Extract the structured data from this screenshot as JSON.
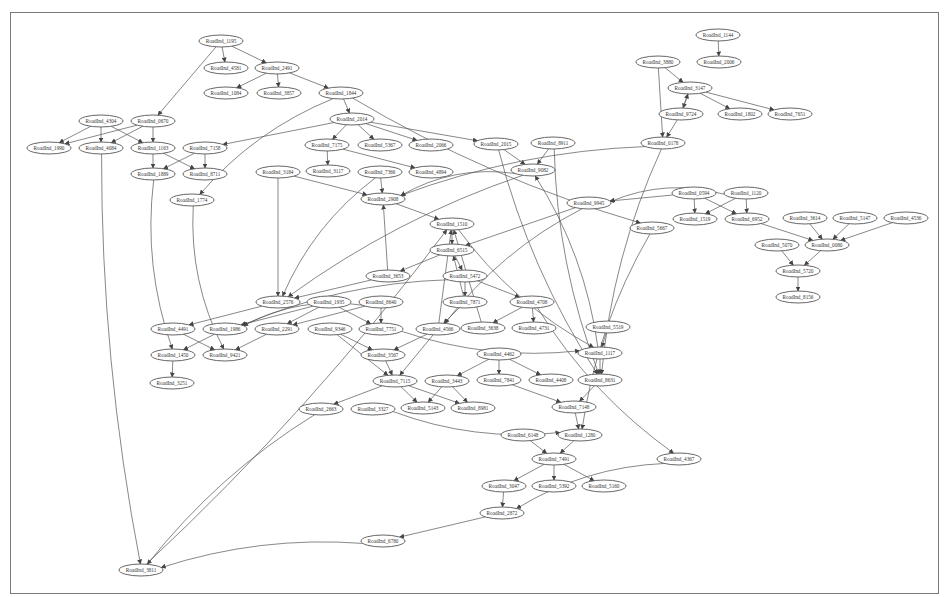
{
  "diagram": {
    "type": "directed-graph",
    "node_prefix": "RoadInd_",
    "nodes": [
      {
        "id": "n1195",
        "label": "RoadInd_1195",
        "x": 221,
        "y": 41
      },
      {
        "id": "n4581",
        "label": "RoadInd_4581",
        "x": 226,
        "y": 68
      },
      {
        "id": "n2491",
        "label": "RoadInd_2491",
        "x": 277,
        "y": 68
      },
      {
        "id": "n1084",
        "label": "RoadInd_1084",
        "x": 226,
        "y": 93
      },
      {
        "id": "n3857",
        "label": "RoadInd_3857",
        "x": 279,
        "y": 93
      },
      {
        "id": "n1844",
        "label": "RoadInd_1844",
        "x": 341,
        "y": 93
      },
      {
        "id": "n1144",
        "label": "RoadInd_1144",
        "x": 718,
        "y": 35
      },
      {
        "id": "n3880",
        "label": "RoadInd_3880",
        "x": 658,
        "y": 62
      },
      {
        "id": "n2006",
        "label": "RoadInd_2006",
        "x": 719,
        "y": 62
      },
      {
        "id": "n3147",
        "label": "RoadInd_3147",
        "x": 690,
        "y": 88
      },
      {
        "id": "n9724",
        "label": "RoadInd_9724",
        "x": 681,
        "y": 114
      },
      {
        "id": "n1802",
        "label": "RoadInd_1802",
        "x": 740,
        "y": 114
      },
      {
        "id": "n7651",
        "label": "RoadInd_7651",
        "x": 790,
        "y": 114
      },
      {
        "id": "n4304",
        "label": "RoadInd_4304",
        "x": 101,
        "y": 121
      },
      {
        "id": "n0670",
        "label": "RoadInd_0670",
        "x": 153,
        "y": 121
      },
      {
        "id": "n2014",
        "label": "RoadInd_2014",
        "x": 352,
        "y": 119
      },
      {
        "id": "n1990",
        "label": "RoadInd_1990",
        "x": 49,
        "y": 148
      },
      {
        "id": "n4084",
        "label": "RoadInd_4084",
        "x": 101,
        "y": 148
      },
      {
        "id": "n1163",
        "label": "RoadInd_1163",
        "x": 153,
        "y": 148
      },
      {
        "id": "n7158",
        "label": "RoadInd_7158",
        "x": 205,
        "y": 148
      },
      {
        "id": "n7175",
        "label": "RoadInd_7175",
        "x": 327,
        "y": 145
      },
      {
        "id": "n5367",
        "label": "RoadInd_5367",
        "x": 380,
        "y": 145
      },
      {
        "id": "n2066",
        "label": "RoadInd_2066",
        "x": 431,
        "y": 145
      },
      {
        "id": "n2015",
        "label": "RoadInd_2015",
        "x": 496,
        "y": 144
      },
      {
        "id": "n8911",
        "label": "RoadInd_8911",
        "x": 553,
        "y": 143
      },
      {
        "id": "n0178",
        "label": "RoadInd_0178",
        "x": 663,
        "y": 143
      },
      {
        "id": "n1889",
        "label": "RoadInd_1889",
        "x": 153,
        "y": 174
      },
      {
        "id": "n8711",
        "label": "RoadInd_8711",
        "x": 205,
        "y": 174
      },
      {
        "id": "n3184",
        "label": "RoadInd_3184",
        "x": 278,
        "y": 172
      },
      {
        "id": "n3117",
        "label": "RoadInd_3117",
        "x": 328,
        "y": 171
      },
      {
        "id": "n7366",
        "label": "RoadInd_7366",
        "x": 380,
        "y": 172
      },
      {
        "id": "n4894",
        "label": "RoadInd_4894",
        "x": 431,
        "y": 172
      },
      {
        "id": "n9082",
        "label": "RoadInd_9082",
        "x": 533,
        "y": 170
      },
      {
        "id": "n1774",
        "label": "RoadInd_1774",
        "x": 192,
        "y": 200
      },
      {
        "id": "n2908",
        "label": "RoadInd_2908",
        "x": 383,
        "y": 199
      },
      {
        "id": "n0594",
        "label": "RoadInd_0594",
        "x": 694,
        "y": 193
      },
      {
        "id": "n1120",
        "label": "RoadInd_1120",
        "x": 746,
        "y": 193
      },
      {
        "id": "n9945",
        "label": "RoadInd_9945",
        "x": 589,
        "y": 203
      },
      {
        "id": "n1519",
        "label": "RoadInd_1519",
        "x": 695,
        "y": 219
      },
      {
        "id": "n6952",
        "label": "RoadInd_6952",
        "x": 747,
        "y": 219
      },
      {
        "id": "n3614",
        "label": "RoadInd_3614",
        "x": 805,
        "y": 218
      },
      {
        "id": "n5147",
        "label": "RoadInd_5147",
        "x": 855,
        "y": 218
      },
      {
        "id": "n4536",
        "label": "RoadInd_4536",
        "x": 906,
        "y": 218
      },
      {
        "id": "n1510",
        "label": "RoadInd_1510",
        "x": 452,
        "y": 224
      },
      {
        "id": "n5667",
        "label": "RoadInd_5667",
        "x": 652,
        "y": 228
      },
      {
        "id": "n6515",
        "label": "RoadInd_6515",
        "x": 452,
        "y": 250
      },
      {
        "id": "n5070",
        "label": "RoadInd_5070",
        "x": 777,
        "y": 245
      },
      {
        "id": "n0080",
        "label": "RoadInd_0080",
        "x": 827,
        "y": 245
      },
      {
        "id": "n3653",
        "label": "RoadInd_3653",
        "x": 388,
        "y": 276
      },
      {
        "id": "n5472",
        "label": "RoadInd_5472",
        "x": 465,
        "y": 276
      },
      {
        "id": "n5720",
        "label": "RoadInd_5720",
        "x": 798,
        "y": 271
      },
      {
        "id": "n2576",
        "label": "RoadInd_2576",
        "x": 278,
        "y": 302
      },
      {
        "id": "n1935",
        "label": "RoadInd_1935",
        "x": 329,
        "y": 302
      },
      {
        "id": "n8640",
        "label": "RoadInd_8640",
        "x": 381,
        "y": 302
      },
      {
        "id": "n7871",
        "label": "RoadInd_7871",
        "x": 465,
        "y": 302
      },
      {
        "id": "n4708",
        "label": "RoadInd_4708",
        "x": 532,
        "y": 302
      },
      {
        "id": "n8156",
        "label": "RoadInd_8156",
        "x": 798,
        "y": 297
      },
      {
        "id": "n4491",
        "label": "RoadInd_4491",
        "x": 173,
        "y": 329
      },
      {
        "id": "n1986",
        "label": "RoadInd_1986",
        "x": 225,
        "y": 329
      },
      {
        "id": "n2291",
        "label": "RoadInd_2291",
        "x": 277,
        "y": 329
      },
      {
        "id": "n9346",
        "label": "RoadInd_9346",
        "x": 330,
        "y": 329
      },
      {
        "id": "n7751",
        "label": "RoadInd_7751",
        "x": 381,
        "y": 329
      },
      {
        "id": "n4566",
        "label": "RoadInd_4566",
        "x": 438,
        "y": 329
      },
      {
        "id": "n3638",
        "label": "RoadInd_3638",
        "x": 483,
        "y": 328
      },
      {
        "id": "n4731",
        "label": "RoadInd_4731",
        "x": 534,
        "y": 328
      },
      {
        "id": "n5519",
        "label": "RoadInd_5519",
        "x": 608,
        "y": 327
      },
      {
        "id": "n1450",
        "label": "RoadInd_1450",
        "x": 173,
        "y": 355
      },
      {
        "id": "n9421",
        "label": "RoadInd_9421",
        "x": 225,
        "y": 355
      },
      {
        "id": "n3567",
        "label": "RoadInd_3567",
        "x": 383,
        "y": 355
      },
      {
        "id": "n4462",
        "label": "RoadInd_4462",
        "x": 499,
        "y": 354
      },
      {
        "id": "n1117",
        "label": "RoadInd_1117",
        "x": 600,
        "y": 353
      },
      {
        "id": "n3251",
        "label": "RoadInd_3251",
        "x": 172,
        "y": 383
      },
      {
        "id": "n7115",
        "label": "RoadInd_7115",
        "x": 395,
        "y": 381
      },
      {
        "id": "n3443",
        "label": "RoadInd_3443",
        "x": 447,
        "y": 381
      },
      {
        "id": "n7841",
        "label": "RoadInd_7841",
        "x": 499,
        "y": 380
      },
      {
        "id": "n4408",
        "label": "RoadInd_4408",
        "x": 551,
        "y": 380
      },
      {
        "id": "n8631",
        "label": "RoadInd_8631",
        "x": 600,
        "y": 380
      },
      {
        "id": "n2663",
        "label": "RoadInd_2663",
        "x": 321,
        "y": 409
      },
      {
        "id": "n3327",
        "label": "RoadInd_3327",
        "x": 373,
        "y": 409
      },
      {
        "id": "n5143",
        "label": "RoadInd_5143",
        "x": 423,
        "y": 408
      },
      {
        "id": "n8981",
        "label": "RoadInd_8981",
        "x": 473,
        "y": 408
      },
      {
        "id": "n7148",
        "label": "RoadInd_7148",
        "x": 574,
        "y": 407
      },
      {
        "id": "n6148",
        "label": "RoadInd_6148",
        "x": 523,
        "y": 435
      },
      {
        "id": "n1280",
        "label": "RoadInd_1280",
        "x": 580,
        "y": 435
      },
      {
        "id": "n4367",
        "label": "RoadInd_4367",
        "x": 679,
        "y": 459
      },
      {
        "id": "n7491",
        "label": "RoadInd_7491",
        "x": 554,
        "y": 459
      },
      {
        "id": "n3047",
        "label": "RoadInd_3047",
        "x": 504,
        "y": 486
      },
      {
        "id": "n5392",
        "label": "RoadInd_5392",
        "x": 554,
        "y": 486
      },
      {
        "id": "n5160",
        "label": "RoadInd_5160",
        "x": 604,
        "y": 486
      },
      {
        "id": "n2872",
        "label": "RoadInd_2872",
        "x": 502,
        "y": 513
      },
      {
        "id": "n6780",
        "label": "RoadInd_6780",
        "x": 383,
        "y": 541
      },
      {
        "id": "n3811",
        "label": "RoadInd_3811",
        "x": 141,
        "y": 570
      }
    ],
    "edges": [
      [
        "n1195",
        "n4581"
      ],
      [
        "n1195",
        "n2491"
      ],
      [
        "n1195",
        "n0670"
      ],
      [
        "n2491",
        "n1084"
      ],
      [
        "n2491",
        "n3857"
      ],
      [
        "n2491",
        "n1844"
      ],
      [
        "n1844",
        "n2014"
      ],
      [
        "n1844",
        "n1774"
      ],
      [
        "n1844",
        "n5667"
      ],
      [
        "n1144",
        "n2006"
      ],
      [
        "n3880",
        "n3147"
      ],
      [
        "n3880",
        "n0178"
      ],
      [
        "n3147",
        "n9724"
      ],
      [
        "n9724",
        "n3147"
      ],
      [
        "n3147",
        "n1802"
      ],
      [
        "n3147",
        "n7651"
      ],
      [
        "n9724",
        "n0178"
      ],
      [
        "n4304",
        "n1990"
      ],
      [
        "n4304",
        "n4084"
      ],
      [
        "n4304",
        "n1163"
      ],
      [
        "n0670",
        "n1990"
      ],
      [
        "n0670",
        "n4084"
      ],
      [
        "n0670",
        "n1163"
      ],
      [
        "n1163",
        "n1889"
      ],
      [
        "n1163",
        "n8711"
      ],
      [
        "n7158",
        "n1889"
      ],
      [
        "n7158",
        "n8711"
      ],
      [
        "n2014",
        "n7158"
      ],
      [
        "n2014",
        "n7175"
      ],
      [
        "n2014",
        "n5367"
      ],
      [
        "n2014",
        "n2066"
      ],
      [
        "n2014",
        "n2015"
      ],
      [
        "n7175",
        "n3117"
      ],
      [
        "n7175",
        "n4894"
      ],
      [
        "n2015",
        "n9082"
      ],
      [
        "n2015",
        "n8631"
      ],
      [
        "n8911",
        "n9082"
      ],
      [
        "n8911",
        "n8631"
      ],
      [
        "n0178",
        "n2908"
      ],
      [
        "n0178",
        "n8631"
      ],
      [
        "n3184",
        "n2908"
      ],
      [
        "n3184",
        "n2576"
      ],
      [
        "n7366",
        "n2908"
      ],
      [
        "n7366",
        "n2576"
      ],
      [
        "n9082",
        "n2908"
      ],
      [
        "n9082",
        "n2576"
      ],
      [
        "n2908",
        "n1510"
      ],
      [
        "n1889",
        "n1450"
      ],
      [
        "n4084",
        "n3811"
      ],
      [
        "n1774",
        "n9421"
      ],
      [
        "n0594",
        "n1519"
      ],
      [
        "n0594",
        "n6952"
      ],
      [
        "n0594",
        "n9945"
      ],
      [
        "n1120",
        "n1519"
      ],
      [
        "n1120",
        "n6952"
      ],
      [
        "n1120",
        "n9945"
      ],
      [
        "n6952",
        "n0080"
      ],
      [
        "n3614",
        "n0080"
      ],
      [
        "n5147",
        "n0080"
      ],
      [
        "n4536",
        "n0080"
      ],
      [
        "n5070",
        "n5720"
      ],
      [
        "n0080",
        "n5720"
      ],
      [
        "n5720",
        "n8156"
      ],
      [
        "n9945",
        "n6515"
      ],
      [
        "n9945",
        "n4566"
      ],
      [
        "n1510",
        "n6515"
      ],
      [
        "n1510",
        "n1117"
      ],
      [
        "n6515",
        "n3653"
      ],
      [
        "n6515",
        "n5472"
      ],
      [
        "n3653",
        "n2576"
      ],
      [
        "n3653",
        "n2908"
      ],
      [
        "n5472",
        "n7871"
      ],
      [
        "n5472",
        "n4708"
      ],
      [
        "n5472",
        "n1986"
      ],
      [
        "n7871",
        "n6515"
      ],
      [
        "n7871",
        "n4566"
      ],
      [
        "n4566",
        "n1510"
      ],
      [
        "n4566",
        "n3567"
      ],
      [
        "n4566",
        "n7115"
      ],
      [
        "n4708",
        "n3638"
      ],
      [
        "n4708",
        "n4731"
      ],
      [
        "n4708",
        "n4367"
      ],
      [
        "n3638",
        "n1510"
      ],
      [
        "n2576",
        "n4491"
      ],
      [
        "n1935",
        "n1986"
      ],
      [
        "n1935",
        "n2291"
      ],
      [
        "n1935",
        "n7751"
      ],
      [
        "n8640",
        "n1986"
      ],
      [
        "n8640",
        "n2291"
      ],
      [
        "n8640",
        "n7751"
      ],
      [
        "n4491",
        "n9421"
      ],
      [
        "n1986",
        "n1450"
      ],
      [
        "n2291",
        "n9421"
      ],
      [
        "n9346",
        "n3567"
      ],
      [
        "n9346",
        "n7115"
      ],
      [
        "n1450",
        "n3251"
      ],
      [
        "n3567",
        "n7115"
      ],
      [
        "n7751",
        "n1117"
      ],
      [
        "n5519",
        "n1117"
      ],
      [
        "n1117",
        "n8631"
      ],
      [
        "n1117",
        "n9082"
      ],
      [
        "n5667",
        "n1280"
      ],
      [
        "n4462",
        "n3443"
      ],
      [
        "n4462",
        "n7841"
      ],
      [
        "n4462",
        "n4408"
      ],
      [
        "n7115",
        "n2663"
      ],
      [
        "n7115",
        "n5143"
      ],
      [
        "n7115",
        "n8981"
      ],
      [
        "n3443",
        "n5143"
      ],
      [
        "n3443",
        "n8981"
      ],
      [
        "n7841",
        "n7148"
      ],
      [
        "n8631",
        "n7148"
      ],
      [
        "n3327",
        "n1280"
      ],
      [
        "n7148",
        "n1280"
      ],
      [
        "n6148",
        "n7491"
      ],
      [
        "n1280",
        "n7491"
      ],
      [
        "n7491",
        "n3047"
      ],
      [
        "n7491",
        "n5392"
      ],
      [
        "n7491",
        "n5160"
      ],
      [
        "n3047",
        "n2872"
      ],
      [
        "n4367",
        "n2872"
      ],
      [
        "n2872",
        "n6780"
      ],
      [
        "n6780",
        "n3811"
      ],
      [
        "n2663",
        "n3811"
      ],
      [
        "n3811",
        "n1510"
      ]
    ]
  },
  "colors": {
    "stroke": "#555555",
    "frame": "#7a7a7a",
    "background": "#ffffff"
  }
}
